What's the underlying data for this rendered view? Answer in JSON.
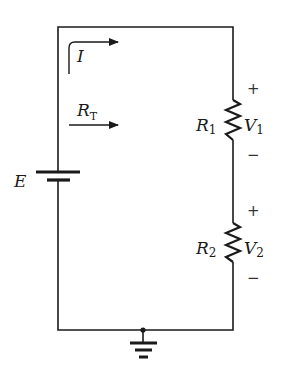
{
  "diagram": {
    "type": "series-circuit",
    "colors": {
      "wire": "#1a1a1a",
      "background": "#ffffff"
    },
    "source": {
      "label": "E"
    },
    "current": {
      "label": "I"
    },
    "total_resistance": {
      "label": "R",
      "subscript": "T"
    },
    "resistors": [
      {
        "label": "R",
        "subscript": "1",
        "voltage_label": "V",
        "voltage_subscript": "1",
        "plus": "+",
        "minus": "−"
      },
      {
        "label": "R",
        "subscript": "2",
        "voltage_label": "V",
        "voltage_subscript": "2",
        "plus": "+",
        "minus": "−"
      }
    ],
    "ground": {
      "symbol": "ground-icon"
    }
  }
}
